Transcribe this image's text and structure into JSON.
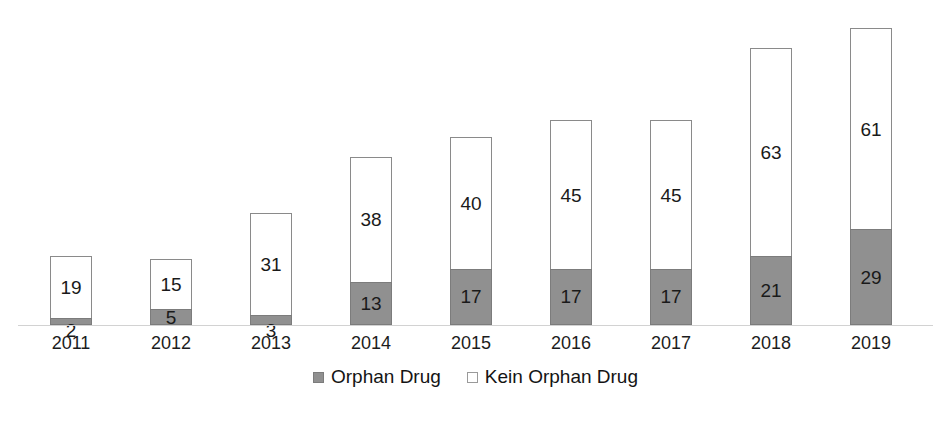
{
  "chart_data": {
    "type": "bar",
    "subtype": "stacked-column",
    "title": "",
    "subtitle": "",
    "xlabel": "",
    "ylabel": "",
    "grid": false,
    "axis": {
      "y_visible": false,
      "y_ticks": [],
      "ylim": [
        0,
        90
      ],
      "x_baseline_visible": true
    },
    "categories": [
      "2011",
      "2012",
      "2013",
      "2014",
      "2015",
      "2016",
      "2017",
      "2018",
      "2019"
    ],
    "series": [
      {
        "name": "Orphan Drug",
        "color": "#909090",
        "stack_position": "bottom",
        "values": [
          2,
          5,
          3,
          13,
          17,
          17,
          17,
          21,
          29
        ]
      },
      {
        "name": "Kein Orphan Drug",
        "color": "#ffffff",
        "stack_position": "top",
        "values": [
          19,
          15,
          31,
          38,
          40,
          45,
          45,
          63,
          61
        ]
      }
    ],
    "totals": [
      21,
      20,
      34,
      51,
      57,
      62,
      62,
      84,
      90
    ],
    "data_labels": true,
    "legend": {
      "position": "bottom",
      "entries": [
        {
          "label": "Orphan Drug",
          "swatch": "filled",
          "color": "#909090"
        },
        {
          "label": "Kein Orphan Drug",
          "swatch": "hollow",
          "color": "#ffffff"
        }
      ]
    }
  },
  "colors": {
    "background": "#ffffff",
    "bar_fill_orphan": "#909090",
    "bar_fill_non_orphan": "#ffffff",
    "bar_border": "#8a8a8a",
    "baseline": "#d2d2d2",
    "text": "#1a1a1a"
  }
}
